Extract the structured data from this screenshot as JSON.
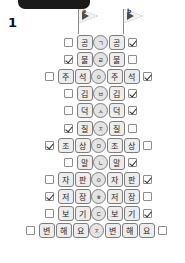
{
  "header": {
    "topbar_present": true,
    "step_number": "1"
  },
  "flags": [
    {
      "label": "a",
      "x": 75,
      "y": 8
    },
    {
      "label": "b",
      "x": 120,
      "y": 8
    }
  ],
  "colors": {
    "tile_fill": "#ededed",
    "tile_border": "#7d7d7d",
    "connector_fill": "#e4e4e4",
    "checkbox_border": "#8d8d8d",
    "topbar": "#1a1a1a",
    "text": "#1d1d1d"
  },
  "rows": [
    {
      "left_checked": false,
      "left_tiles": [
        "공"
      ],
      "connector": "ㄱ",
      "right_tiles": [
        "공"
      ],
      "right_checked": true,
      "indent": 64
    },
    {
      "left_checked": true,
      "left_tiles": [
        "불"
      ],
      "connector": "ㄹ",
      "right_tiles": [
        "불"
      ],
      "right_checked": false,
      "indent": 64
    },
    {
      "left_checked": false,
      "left_tiles": [
        "주",
        "석"
      ],
      "connector": "ㅇ",
      "right_tiles": [
        "주",
        "석"
      ],
      "right_checked": true,
      "indent": 45
    },
    {
      "left_checked": false,
      "left_tiles": [
        "김"
      ],
      "connector": "ㅂ",
      "right_tiles": [
        "김"
      ],
      "right_checked": true,
      "indent": 64
    },
    {
      "left_checked": false,
      "left_tiles": [
        "덕"
      ],
      "connector": "ㅅ",
      "right_tiles": [
        "덕"
      ],
      "right_checked": true,
      "indent": 64
    },
    {
      "left_checked": true,
      "left_tiles": [
        "질"
      ],
      "connector": "ㅈ",
      "right_tiles": [
        "질"
      ],
      "right_checked": false,
      "indent": 64
    },
    {
      "left_checked": true,
      "left_tiles": [
        "조",
        "상"
      ],
      "connector": "ㅁ",
      "right_tiles": [
        "조",
        "상"
      ],
      "right_checked": false,
      "indent": 45
    },
    {
      "left_checked": false,
      "left_tiles": [
        "말"
      ],
      "connector": "ㄴ",
      "right_tiles": [
        "말"
      ],
      "right_checked": true,
      "indent": 64
    },
    {
      "left_checked": false,
      "left_tiles": [
        "자",
        "판"
      ],
      "connector": "ㅇ",
      "right_tiles": [
        "자",
        "판"
      ],
      "right_checked": true,
      "indent": 45
    },
    {
      "left_checked": true,
      "left_tiles": [
        "저",
        "장"
      ],
      "connector": "ㅎ",
      "right_tiles": [
        "저",
        "장"
      ],
      "right_checked": false,
      "indent": 45
    },
    {
      "left_checked": false,
      "left_tiles": [
        "보",
        "기"
      ],
      "connector": "ㄷ",
      "right_tiles": [
        "보",
        "기"
      ],
      "right_checked": true,
      "indent": 45
    },
    {
      "left_checked": false,
      "left_tiles": [
        "변",
        "해",
        "요"
      ],
      "connector": "ㅈ",
      "right_tiles": [
        "변",
        "해",
        "요"
      ],
      "right_checked": false,
      "indent": 26
    }
  ]
}
